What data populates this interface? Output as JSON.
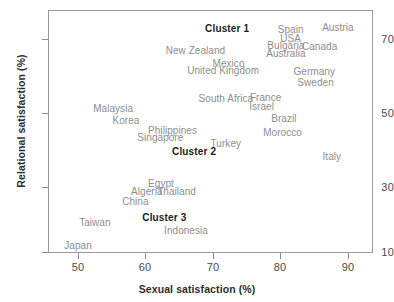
{
  "chart_data": {
    "type": "scatter",
    "title": "",
    "xlabel": "Sexual satisfaction (%)",
    "ylabel": "Relational satisfaction (%)",
    "xlim": [
      45.5,
      93.5
    ],
    "ylim": [
      10,
      76
    ],
    "xticks": [
      50,
      60,
      70,
      80,
      90
    ],
    "yticks": [
      10,
      30,
      50,
      70
    ],
    "grid": false,
    "legend": "none",
    "point_style": "text-labels-only",
    "label_color": "#8e8e8e",
    "annotation_color": "#1d1d1d",
    "points": [
      {
        "label": "Austria",
        "x": 88.5,
        "y": 73.3,
        "cluster": 1
      },
      {
        "label": "Spain",
        "x": 81.5,
        "y": 72.6,
        "cluster": 1
      },
      {
        "label": "USA",
        "x": 81.5,
        "y": 70.4,
        "cluster": 1
      },
      {
        "label": "Bulgaria",
        "x": 80.8,
        "y": 68.5,
        "cluster": 1
      },
      {
        "label": "Canada",
        "x": 85.8,
        "y": 68.0,
        "cluster": 1
      },
      {
        "label": "Australia",
        "x": 80.8,
        "y": 66.3,
        "cluster": 1
      },
      {
        "label": "New Zealand",
        "x": 67.4,
        "y": 67.1,
        "cluster": 1
      },
      {
        "label": "Mexico",
        "x": 72.3,
        "y": 63.5,
        "cluster": 1
      },
      {
        "label": "United Kingdom",
        "x": 71.5,
        "y": 61.5,
        "cluster": 1
      },
      {
        "label": "Germany",
        "x": 85.0,
        "y": 61.4,
        "cluster": 1
      },
      {
        "label": "Sweden",
        "x": 85.2,
        "y": 58.5,
        "cluster": 1
      },
      {
        "label": "South Africa",
        "x": 71.9,
        "y": 54.1,
        "cluster": 1
      },
      {
        "label": "France",
        "x": 77.8,
        "y": 54.3,
        "cluster": 1
      },
      {
        "label": "Israel",
        "x": 77.2,
        "y": 52.0,
        "cluster": 1
      },
      {
        "label": "Brazil",
        "x": 80.5,
        "y": 48.6,
        "cluster": 1
      },
      {
        "label": "Morocco",
        "x": 80.3,
        "y": 45.0,
        "cluster": 1
      },
      {
        "label": "Italy",
        "x": 87.6,
        "y": 38.5,
        "cluster": 1
      },
      {
        "label": "Malaysia",
        "x": 55.2,
        "y": 51.4,
        "cluster": 2
      },
      {
        "label": "Korea",
        "x": 57.1,
        "y": 48.0,
        "cluster": 2
      },
      {
        "label": "Philippines",
        "x": 64.0,
        "y": 45.3,
        "cluster": 2
      },
      {
        "label": "Singapore",
        "x": 62.2,
        "y": 43.4,
        "cluster": 2
      },
      {
        "label": "Turkey",
        "x": 71.9,
        "y": 42.0,
        "cluster": 2
      },
      {
        "label": "Egypt",
        "x": 62.3,
        "y": 31.2,
        "cluster": 3
      },
      {
        "label": "Algeria",
        "x": 60.2,
        "y": 28.9,
        "cluster": 3
      },
      {
        "label": "Thailand",
        "x": 64.6,
        "y": 28.8,
        "cluster": 3
      },
      {
        "label": "China",
        "x": 58.5,
        "y": 26.3,
        "cluster": 3
      },
      {
        "label": "Taiwan",
        "x": 52.5,
        "y": 20.6,
        "cluster": 3
      },
      {
        "label": "Indonesia",
        "x": 66.0,
        "y": 18.5,
        "cluster": 3
      },
      {
        "label": "Japan",
        "x": 50.0,
        "y": 14.3,
        "cluster": 3
      }
    ],
    "annotations": [
      {
        "label": "Cluster 1",
        "x": 72.1,
        "y": 73.0
      },
      {
        "label": "Cluster 2",
        "x": 67.2,
        "y": 39.8
      },
      {
        "label": "Cluster 3",
        "x": 62.8,
        "y": 21.8
      }
    ]
  },
  "axes": {
    "x_title": "Sexual satisfaction (%)",
    "y_title": "Relational satisfaction (%)",
    "x_tick_labels": [
      "50",
      "60",
      "70",
      "80",
      "90"
    ],
    "y_tick_labels": [
      "70",
      "50",
      "30",
      "10"
    ]
  }
}
